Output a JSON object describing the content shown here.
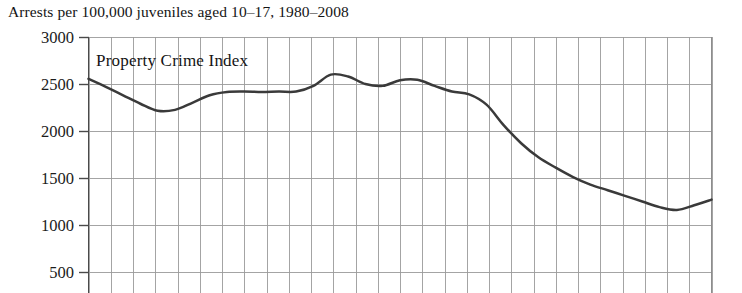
{
  "figure": {
    "title": "Arrests per 100,000 juveniles aged 10–17, 1980–2008",
    "series_annotation": "Property Crime Index",
    "background_color": "#ffffff",
    "line_color": "#3a3a3a",
    "grid_color": "#9a9a9a",
    "axis_color": "#555555",
    "text_color": "#141414"
  },
  "axis": {
    "y_tick_labels": [
      "3000",
      "2500",
      "2000",
      "1500",
      "1000",
      "500"
    ],
    "y_tick_values": [
      3000,
      2500,
      2000,
      1500,
      1000,
      500
    ]
  },
  "chart_data": {
    "type": "line",
    "title": "Arrests per 100,000 juveniles aged 10–17, 1980–2008",
    "xlabel": "",
    "ylabel": "",
    "ylim": [
      0,
      3000
    ],
    "xlim": [
      1980,
      2008
    ],
    "grid": true,
    "legend": "none",
    "annotations": [
      "Property Crime Index"
    ],
    "yticks": [
      500,
      1000,
      1500,
      2000,
      2500,
      3000
    ],
    "x": [
      1980,
      1981,
      1982,
      1983,
      1984,
      1985,
      1986,
      1987,
      1988,
      1989,
      1990,
      1991,
      1992,
      1993,
      1994,
      1995,
      1996,
      1997,
      1998,
      1999,
      2000,
      2001,
      2002,
      2003,
      2004,
      2005,
      2006,
      2007,
      2008
    ],
    "series": [
      {
        "name": "Property Crime Index",
        "values": [
          2555,
          2470,
          2380,
          2290,
          2215,
          2225,
          2300,
          2380,
          2415,
          2420,
          2415,
          2420,
          2420,
          2480,
          2600,
          2580,
          2500,
          2480,
          2540,
          2545,
          2480,
          2420,
          2390,
          2280,
          2060,
          1870,
          1720,
          1610,
          1510
        ]
      }
    ],
    "series_extended_values": [
      2555,
      2470,
      2380,
      2290,
      2215,
      2225,
      2300,
      2380,
      2415,
      2420,
      2415,
      2420,
      2420,
      2480,
      2600,
      2580,
      2500,
      2480,
      2540,
      2545,
      2480,
      2420,
      2390,
      2280,
      2060,
      1870,
      1720,
      1610,
      1510,
      1430,
      1370,
      1310,
      1250,
      1190,
      1160,
      1210,
      1270
    ]
  }
}
